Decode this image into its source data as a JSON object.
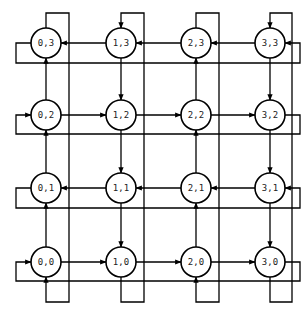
{
  "diagram": {
    "type": "torus-mesh-snake-order",
    "grid": {
      "cols": 4,
      "rows": 4
    },
    "colors": {
      "stroke": "#000000",
      "background": "#ffffff",
      "text": "#222222"
    },
    "layout": {
      "col_x": [
        46,
        121,
        196,
        270
      ],
      "col_offset_x": [
        69,
        144,
        219,
        292
      ],
      "row_y": {
        "0": 262,
        "1": 188,
        "2": 115,
        "3": 43
      },
      "row_wrap_y": {
        "0": 281,
        "1": 208,
        "2": 134,
        "3": 63
      },
      "top_y": 13,
      "bottom_y": 302,
      "left_x": 16,
      "right_x": 300,
      "radius": 15
    },
    "nodes": [
      {
        "id": "0,0",
        "label": "0,0",
        "col": 0,
        "row": 0
      },
      {
        "id": "1,0",
        "label": "1,0",
        "col": 1,
        "row": 0
      },
      {
        "id": "2,0",
        "label": "2,0",
        "col": 2,
        "row": 0
      },
      {
        "id": "3,0",
        "label": "3,0",
        "col": 3,
        "row": 0
      },
      {
        "id": "0,1",
        "label": "0,1",
        "col": 0,
        "row": 1
      },
      {
        "id": "1,1",
        "label": "1,1",
        "col": 1,
        "row": 1
      },
      {
        "id": "2,1",
        "label": "2,1",
        "col": 2,
        "row": 1
      },
      {
        "id": "3,1",
        "label": "3,1",
        "col": 3,
        "row": 1
      },
      {
        "id": "0,2",
        "label": "0,2",
        "col": 0,
        "row": 2
      },
      {
        "id": "1,2",
        "label": "1,2",
        "col": 1,
        "row": 2
      },
      {
        "id": "2,2",
        "label": "2,2",
        "col": 2,
        "row": 2
      },
      {
        "id": "3,2",
        "label": "3,2",
        "col": 3,
        "row": 2
      },
      {
        "id": "0,3",
        "label": "0,3",
        "col": 0,
        "row": 3
      },
      {
        "id": "1,3",
        "label": "1,3",
        "col": 1,
        "row": 3
      },
      {
        "id": "2,3",
        "label": "2,3",
        "col": 2,
        "row": 3
      },
      {
        "id": "3,3",
        "label": "3,3",
        "col": 3,
        "row": 3
      }
    ],
    "row_directions": {
      "0": "right",
      "1": "left",
      "2": "right",
      "3": "left"
    },
    "col_directions": {
      "0": "up",
      "1": "down",
      "2": "up",
      "3": "down"
    }
  }
}
